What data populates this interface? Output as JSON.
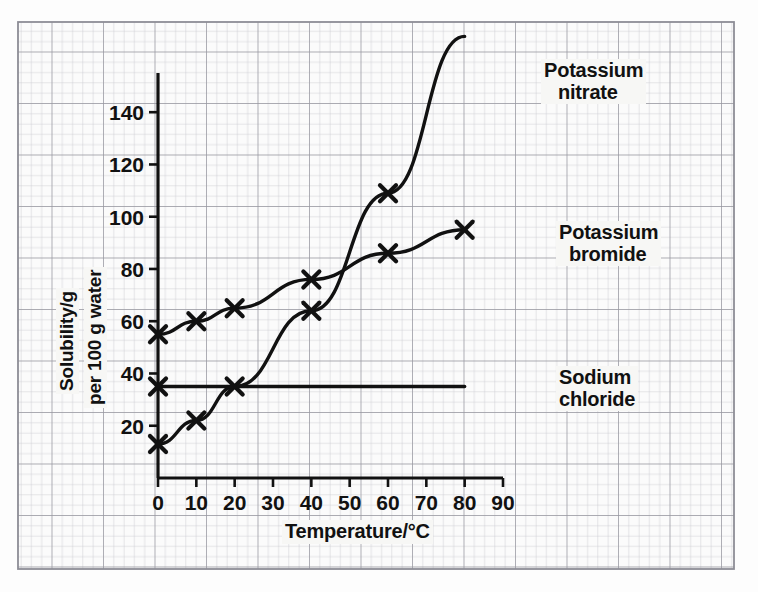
{
  "chart_data": {
    "type": "line",
    "title": "",
    "xlabel": "Temperature/°C",
    "ylabel_line1": "Solubility/g",
    "ylabel_line2": "per 100 g water",
    "xlim": [
      0,
      90
    ],
    "ylim": [
      0,
      155
    ],
    "xticks": [
      0,
      10,
      20,
      30,
      40,
      50,
      60,
      70,
      80,
      90
    ],
    "yticks": [
      20,
      40,
      60,
      80,
      100,
      120,
      140
    ],
    "xtick_labels": [
      "0",
      "10",
      "20",
      "30",
      "40",
      "50",
      "60",
      "70",
      "80",
      "90"
    ],
    "ytick_labels": [
      "20",
      "40",
      "60",
      "80",
      "100",
      "120",
      "140"
    ],
    "grid": "graph-paper",
    "legend_position": "inline-right-annotations",
    "marker": "cross",
    "line_color": "#111111",
    "grid_color_minor": "#c9c9cf",
    "grid_color_major": "#9a9aa4",
    "paper_background": "#fbfbfb",
    "series": [
      {
        "name": "Potassium nitrate",
        "label_line1": "Potassium",
        "label_line2": "nitrate",
        "x": [
          0,
          10,
          20,
          40,
          60,
          80
        ],
        "values": [
          13,
          22,
          35,
          64,
          109,
          169
        ],
        "marked_x": [
          0,
          10,
          20,
          40,
          60
        ],
        "marked_values": [
          13,
          22,
          35,
          64,
          109
        ]
      },
      {
        "name": "Potassium bromide",
        "label_line1": "Potassium",
        "label_line2": "bromide",
        "x": [
          0,
          10,
          20,
          40,
          60,
          80
        ],
        "values": [
          55,
          60,
          65,
          76,
          86,
          95
        ],
        "marked_x": [
          0,
          10,
          20,
          40,
          60,
          80
        ],
        "marked_values": [
          55,
          60,
          65,
          76,
          86,
          95
        ]
      },
      {
        "name": "Sodium chloride",
        "label_line1": "Sodium",
        "label_line2": "chloride",
        "x": [
          0,
          80
        ],
        "values": [
          35,
          35
        ],
        "marked_x": [
          0
        ],
        "marked_values": [
          35
        ]
      }
    ]
  },
  "annotations": {
    "potassium_nitrate_line1": "Potassium",
    "potassium_nitrate_line2": "nitrate",
    "potassium_bromide_line1": "Potassium",
    "potassium_bromide_line2": "bromide",
    "sodium_chloride_line1": "Sodium",
    "sodium_chloride_line2": "chloride"
  },
  "axes": {
    "x_title": "Temperature/°C",
    "y_title_line1": "Solubility/g",
    "y_title_line2": "per 100 g water"
  }
}
